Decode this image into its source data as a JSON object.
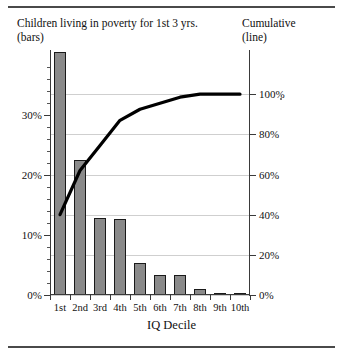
{
  "header": {
    "left_line1": "Children living in poverty for 1st 3 yrs.",
    "left_line2": "(bars)",
    "right_line1": "Cumulative",
    "right_line2": "(line)"
  },
  "chart_data": {
    "type": "bar",
    "xlabel": "IQ Decile",
    "ylabel": "",
    "categories": [
      "1st",
      "2nd",
      "3rd",
      "4th",
      "5th",
      "6th",
      "7th",
      "8th",
      "9th",
      "10th"
    ],
    "series": [
      {
        "name": "Children living in poverty for 1st 3 yrs. (bars)",
        "type": "bar",
        "axis": "left",
        "unit": "%",
        "values": [
          40.5,
          22.5,
          12.8,
          12.6,
          5.3,
          3.4,
          3.3,
          1.0,
          0.2,
          0.1
        ]
      },
      {
        "name": "Cumulative (line)",
        "type": "line",
        "axis": "right",
        "unit": "%",
        "values": [
          40.0,
          62.0,
          74.5,
          87.0,
          92.5,
          95.5,
          98.5,
          100.0,
          100.0,
          100.0
        ]
      }
    ],
    "left_axis": {
      "label": "",
      "ticks": [
        "0%",
        "10%",
        "20%",
        "30%"
      ],
      "tick_values": [
        0,
        10,
        20,
        30
      ],
      "lim": [
        0,
        40.8
      ],
      "minor_ticks": true
    },
    "right_axis": {
      "label": "",
      "ticks": [
        "0%",
        "20%",
        "40%",
        "60%",
        "80%",
        "100%"
      ],
      "tick_values": [
        0,
        20,
        40,
        60,
        80,
        100
      ],
      "lim": [
        0,
        122
      ]
    },
    "grid": "horizontal",
    "legend_position": "top",
    "colors": {
      "bar_fill": "#8a8a8a",
      "bar_edge": "#1a1a1a",
      "line": "#000000",
      "grid": "#cfcfcf"
    }
  }
}
